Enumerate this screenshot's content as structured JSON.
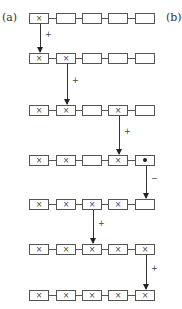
{
  "labels": {
    "a": "(a)",
    "b": "(b)"
  },
  "symbols": {
    "marked": "×",
    "empty": "",
    "dot": "●"
  },
  "rows": [
    {
      "cells": [
        "x",
        "",
        "",
        "",
        ""
      ]
    },
    {
      "cells": [
        "x",
        "x",
        "",
        "",
        ""
      ]
    },
    {
      "cells": [
        "x",
        "x",
        "",
        "x",
        ""
      ]
    },
    {
      "cells": [
        "x",
        "x",
        "",
        "x",
        "dot"
      ]
    },
    {
      "cells": [
        "x",
        "x",
        "x",
        "x",
        ""
      ]
    },
    {
      "cells": [
        "x",
        "x",
        "x",
        "x",
        "x"
      ]
    },
    {
      "cells": [
        "x",
        "x",
        "x",
        "x",
        "x"
      ]
    }
  ],
  "transitions": [
    {
      "from_row": 1,
      "to_row": 2,
      "column": 1,
      "sign": "+"
    },
    {
      "from_row": 2,
      "to_row": 3,
      "column": 2,
      "sign": "+"
    },
    {
      "from_row": 3,
      "to_row": 4,
      "column": 4,
      "sign": "+"
    },
    {
      "from_row": 4,
      "to_row": 5,
      "column": 5,
      "sign": "−"
    },
    {
      "from_row": 5,
      "to_row": 6,
      "column": 3,
      "sign": "+"
    },
    {
      "from_row": 6,
      "to_row": 7,
      "column": 5,
      "sign": "+"
    }
  ]
}
